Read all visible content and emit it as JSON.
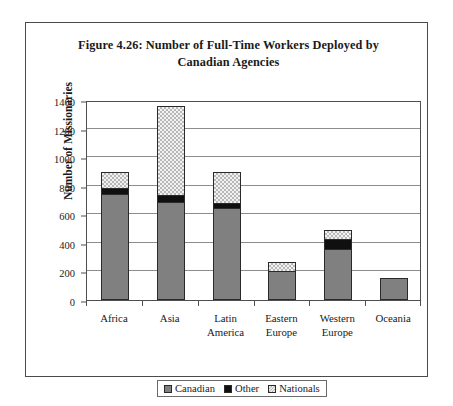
{
  "figure": {
    "title": "Figure 4.26: Number of Full-Time Workers Deployed by Canadian Agencies"
  },
  "chart_data": {
    "type": "bar",
    "stacked": true,
    "title": "Figure 4.26: Number of Full-Time Workers Deployed by Canadian Agencies",
    "xlabel": "",
    "ylabel": "Number of Missionaries",
    "ylim": [
      0,
      1400
    ],
    "ytick_step": 200,
    "yticks": [
      0,
      200,
      400,
      600,
      800,
      1000,
      1200,
      1400
    ],
    "ytick_labels": [
      "0",
      "200",
      "400",
      "600",
      "800",
      "1000",
      "1200",
      "1400"
    ],
    "grid": true,
    "legend_position": "bottom",
    "categories": [
      "Africa",
      "Asia",
      "Latin America",
      "Eastern Europe",
      "Western Europe",
      "Oceania"
    ],
    "series": [
      {
        "name": "Canadian",
        "color": "#808080",
        "values": [
          735,
          680,
          635,
          195,
          350,
          145
        ]
      },
      {
        "name": "Other",
        "color": "#101010",
        "values": [
          45,
          50,
          40,
          0,
          70,
          0
        ]
      },
      {
        "name": "Nationals",
        "color": "#f2f2f2",
        "values": [
          110,
          620,
          215,
          65,
          60,
          0
        ]
      }
    ],
    "totals": [
      890,
      1350,
      890,
      260,
      480,
      145
    ]
  },
  "legend": {
    "items": [
      {
        "label": "Canadian"
      },
      {
        "label": "Other"
      },
      {
        "label": "Nationals"
      }
    ]
  }
}
